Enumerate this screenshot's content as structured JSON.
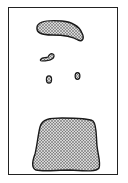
{
  "figure": {
    "background": "#ffffff",
    "frame_color": "#222222",
    "stroke_color": "#1a1a1a",
    "fill_color": "#9a9a9a",
    "shapes": [
      {
        "name": "top-crescent-blob"
      },
      {
        "name": "small-curved-blob"
      },
      {
        "name": "left-small-oval"
      },
      {
        "name": "right-small-oval"
      },
      {
        "name": "bottom-large-blob"
      }
    ]
  }
}
